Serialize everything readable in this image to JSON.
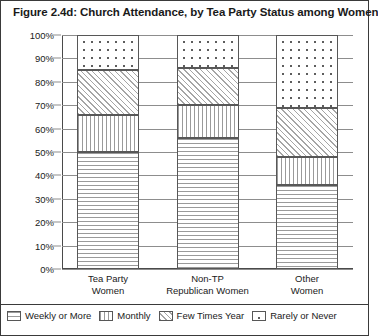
{
  "title": "Figure 2.4d: Church Attendance, by Tea Party Status among Women",
  "chart_data": {
    "type": "bar",
    "subtype": "stacked-100-percent",
    "title": "Figure 2.4d: Church Attendance, by Tea Party Status among Women",
    "xlabel": "",
    "ylabel": "",
    "ylim": [
      0,
      100
    ],
    "ytick_labels": [
      "100%",
      "90%",
      "80%",
      "70%",
      "60%",
      "50%",
      "40%",
      "30%",
      "20%",
      "10%",
      "0%"
    ],
    "ytick_values": [
      100,
      90,
      80,
      70,
      60,
      50,
      40,
      30,
      20,
      10,
      0
    ],
    "grid": true,
    "legend_position": "bottom",
    "categories": [
      "Tea Party Women",
      "Non-TP Republican Women",
      "Other Women"
    ],
    "category_lines": [
      [
        "Tea Party",
        "Women"
      ],
      [
        "Non-TP",
        "Republican Women"
      ],
      [
        "Other",
        "Women"
      ]
    ],
    "series": [
      {
        "name": "Weekly or More",
        "pattern": "horizontal",
        "values": [
          50,
          56,
          36
        ]
      },
      {
        "name": "Monthly",
        "pattern": "vertical",
        "values": [
          16,
          14,
          12
        ]
      },
      {
        "name": "Few Times Year",
        "pattern": "diagonal",
        "values": [
          19,
          16,
          21
        ]
      },
      {
        "name": "Rarely or Never",
        "pattern": "dots",
        "values": [
          15,
          14,
          31
        ]
      }
    ]
  },
  "legend": {
    "items": [
      {
        "label": "Weekly or More"
      },
      {
        "label": "Monthly"
      },
      {
        "label": "Few Times Year"
      },
      {
        "label": "Rarely or Never"
      }
    ]
  }
}
